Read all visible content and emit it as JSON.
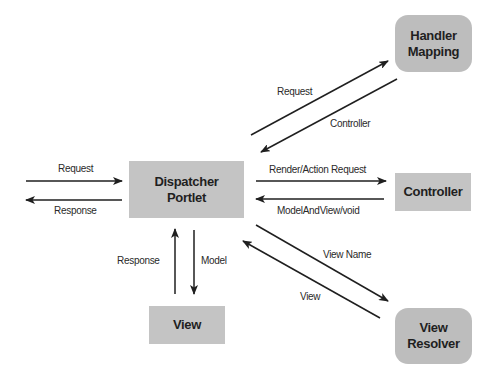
{
  "diagram": {
    "colors": {
      "box_fill": "#c4c4c4",
      "rounded_box_fill": "#bdbdbd",
      "arrow": "#1f1f1f",
      "text": "#1f1f1f"
    },
    "nodes": {
      "dispatcher": {
        "line1": "Dispatcher",
        "line2": "Portlet",
        "shape": "rectangle"
      },
      "handler_mapping": {
        "line1": "Handler",
        "line2": "Mapping",
        "shape": "rounded"
      },
      "controller": {
        "label": "Controller",
        "shape": "rectangle"
      },
      "view": {
        "label": "View",
        "shape": "rectangle"
      },
      "view_resolver": {
        "line1": "View",
        "line2": "Resolver",
        "shape": "rounded"
      }
    },
    "edges": {
      "client_request": {
        "label": "Request",
        "from": "client",
        "to": "dispatcher"
      },
      "client_response": {
        "label": "Response",
        "from": "dispatcher",
        "to": "client"
      },
      "hm_request": {
        "label": "Request",
        "from": "dispatcher",
        "to": "handler_mapping"
      },
      "hm_controller": {
        "label": "Controller",
        "from": "handler_mapping",
        "to": "dispatcher"
      },
      "ctrl_request": {
        "label": "Render/Action Request",
        "from": "dispatcher",
        "to": "controller"
      },
      "ctrl_response": {
        "label": "ModelAndView/void",
        "from": "controller",
        "to": "dispatcher"
      },
      "vr_view_name": {
        "label": "View Name",
        "from": "dispatcher",
        "to": "view_resolver"
      },
      "vr_view": {
        "label": "View",
        "from": "view_resolver",
        "to": "dispatcher"
      },
      "view_model": {
        "label": "Model",
        "from": "dispatcher",
        "to": "view"
      },
      "view_response": {
        "label": "Response",
        "from": "view",
        "to": "dispatcher"
      }
    }
  }
}
